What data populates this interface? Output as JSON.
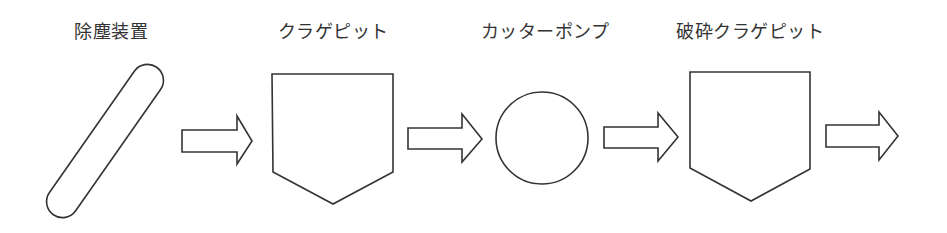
{
  "diagram": {
    "type": "process-flow",
    "direction": "left-to-right",
    "stroke_color": "#333333",
    "fill_color": "#ffffff",
    "nodes": [
      {
        "label": "除塵装置",
        "shape": "pill-tilted"
      },
      {
        "label": "クラゲピット",
        "shape": "pentagon-pit"
      },
      {
        "label": "カッターポンプ",
        "shape": "circle"
      },
      {
        "label": "破砕クラゲピット",
        "shape": "pentagon-pit"
      }
    ],
    "arrows": [
      {
        "from": "除塵装置",
        "to": "クラゲピット",
        "style": "hollow-block-arrow"
      },
      {
        "from": "クラゲピット",
        "to": "カッターポンプ",
        "style": "hollow-block-arrow"
      },
      {
        "from": "カッターポンプ",
        "to": "破砕クラゲピット",
        "style": "hollow-block-arrow"
      },
      {
        "from": "破砕クラゲピット",
        "to": "",
        "style": "hollow-block-arrow"
      }
    ]
  }
}
